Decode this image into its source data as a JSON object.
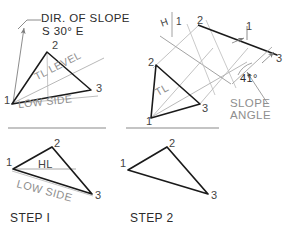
{
  "figure": {
    "title_visible": false,
    "background_color": "#ffffff",
    "ink_color": "#1a1a1a",
    "construction_color": "#a8a8a8",
    "text_color": "#3a3a3a"
  },
  "panels": {
    "top_left": {
      "name": "direction-of-slope-view",
      "annotations": {
        "dir_of_slope": "DIR. OF SLOPE",
        "bearing": "S 30° E",
        "tl_level": "TL LEVEL",
        "low_side": "LOW SIDE"
      },
      "vertices": [
        {
          "label": "1",
          "x": 6,
          "y": 103
        },
        {
          "label": "2",
          "x": 52,
          "y": 47
        },
        {
          "label": "3",
          "x": 96,
          "y": 89
        }
      ]
    },
    "top_right": {
      "name": "slope-angle-view",
      "annotations": {
        "reference_line": "H",
        "reference_line_sub": "1",
        "true_length": "TL",
        "angle_value": "41°",
        "slope_angle": "SLOPE\nANGLE",
        "slope_angle_line1": "SLOPE",
        "slope_angle_line2": "ANGLE"
      },
      "vertices": [
        {
          "label": "2",
          "x": 153,
          "y": 63
        },
        {
          "label": "3",
          "x": 200,
          "y": 103
        },
        {
          "label": "1",
          "x": 152,
          "y": 117
        }
      ],
      "edge_view_points": [
        {
          "label": "2",
          "x": 198,
          "y": 25
        },
        {
          "label": "1",
          "x": 247,
          "y": 32
        },
        {
          "label": "3",
          "x": 278,
          "y": 57
        }
      ]
    },
    "bottom_left": {
      "name": "step-one-view",
      "step_label": "STEP I",
      "annotations": {
        "horizontal_line": "HL",
        "low_side": "LOW SIDE"
      },
      "vertices": [
        {
          "label": "1",
          "x": 7,
          "y": 168
        },
        {
          "label": "2",
          "x": 54,
          "y": 143
        },
        {
          "label": "3",
          "x": 95,
          "y": 195
        }
      ]
    },
    "bottom_right": {
      "name": "step-two-view",
      "step_label": "STEP 2",
      "vertices": [
        {
          "label": "1",
          "x": 122,
          "y": 168
        },
        {
          "label": "2",
          "x": 168,
          "y": 143
        },
        {
          "label": "3",
          "x": 211,
          "y": 196
        }
      ]
    }
  },
  "icons": {
    "leader_arrow": "leader-arrow-icon",
    "slope_arrow": "slope-direction-arrow-icon",
    "angle_pointer": "angle-pointer-arrow-icon"
  }
}
